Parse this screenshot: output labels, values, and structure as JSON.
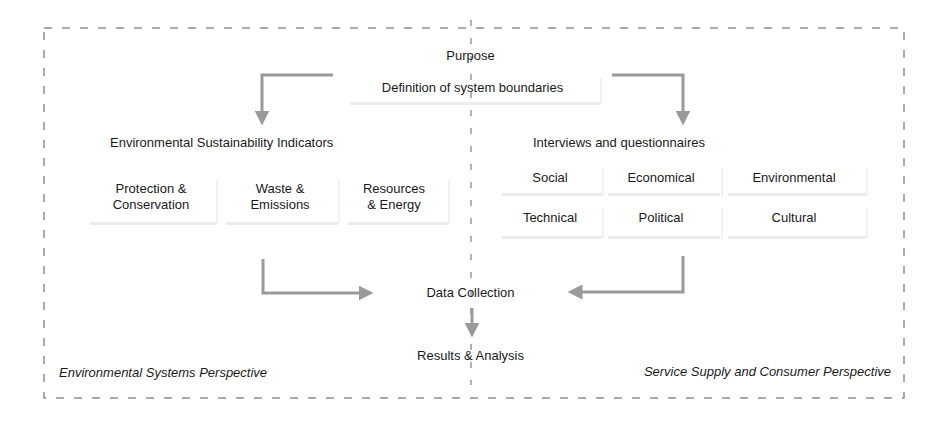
{
  "diagram": {
    "top": {
      "purpose": "Purpose",
      "definition": "Definition of system boundaries"
    },
    "left_branch": {
      "heading": "Environmental Sustainability Indicators",
      "cells": [
        {
          "line1": "Protection &",
          "line2": "Conservation"
        },
        {
          "line1": "Waste &",
          "line2": "Emissions"
        },
        {
          "line1": "Resources",
          "line2": "& Energy"
        }
      ],
      "perspective": "Environmental Systems Perspective"
    },
    "right_branch": {
      "heading": "Interviews and questionnaires",
      "cells_row1": [
        "Social",
        "Economical",
        "Environmental"
      ],
      "cells_row2": [
        "Technical",
        "Political",
        "Cultural"
      ],
      "perspective": "Service Supply and Consumer Perspective"
    },
    "bottom": {
      "data_collection": "Data Collection",
      "results": "Results & Analysis"
    },
    "colors": {
      "arrow": "#9a9a9a",
      "dashed_border": "#8f8f8f",
      "text": "#1a1a1a"
    }
  }
}
